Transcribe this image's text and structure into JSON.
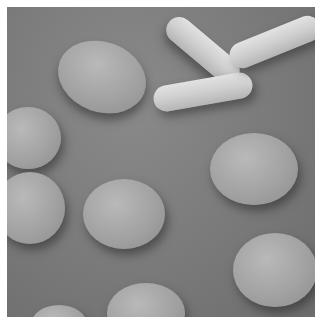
{
  "image": {
    "subject": "scanning electron micrograph of red blood cells including sickled cells",
    "colors": {
      "background": "#ffffff",
      "substrate": "#7a7a7a",
      "cell": "#a8a8a8",
      "sickle_cell": "#d4d4d4"
    }
  }
}
